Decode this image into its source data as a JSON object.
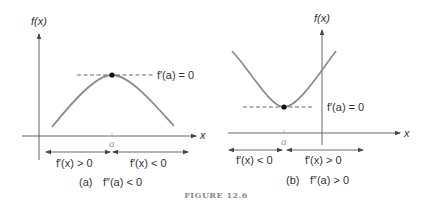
{
  "figure": {
    "caption": "FIGURE 12.6",
    "panels": [
      {
        "id": "a",
        "y_axis_label": "f(x)",
        "x_axis_label": "x",
        "point_label": "a",
        "tangent_label": "f′(a) = 0",
        "left_interval_label": "f′(x) > 0",
        "right_interval_label": "f′(x) < 0",
        "caption_tag": "(a)",
        "caption_condition": "f″(a) < 0",
        "curve": "concave-down (maximum at a)"
      },
      {
        "id": "b",
        "y_axis_label": "f(x)",
        "x_axis_label": "x",
        "point_label": "a",
        "tangent_label": "f′(a) = 0",
        "left_interval_label": "f′(x) < 0",
        "right_interval_label": "f′(x) > 0",
        "caption_tag": "(b)",
        "caption_condition": "f″(a) > 0",
        "curve": "concave-up (minimum at a)"
      }
    ]
  },
  "colors": {
    "curve": "#8c8c8c",
    "axis": "#555555",
    "text": "#333333",
    "caption": "#8a8a8a"
  }
}
